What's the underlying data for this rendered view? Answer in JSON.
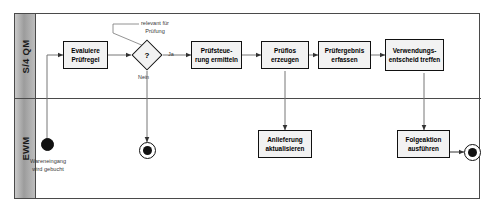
{
  "diagram": {
    "type": "bpmn-swimlane",
    "colors": {
      "lane_header_fill": "#9c9c9c",
      "task_fill": "#f2f2f2",
      "stroke": "#111111",
      "border": "#4a4a4a",
      "connector": "#555555",
      "label_text": "#3a3a3a"
    }
  },
  "lanes": [
    {
      "id": "qm",
      "label": "S/4 QM"
    },
    {
      "id": "ewm",
      "label": "EWM"
    }
  ],
  "tasks": [
    {
      "id": "evaluiere-pruefregel",
      "lane": "qm",
      "line1": "Evaluiere",
      "line2": "Prüfregel"
    },
    {
      "id": "pruefsteuerung",
      "lane": "qm",
      "line1": "Prüfsteue-",
      "line2": "rung ermitteln"
    },
    {
      "id": "pruefl0s-erzeugen",
      "lane": "qm",
      "line1": "Prüflos",
      "line2": "erzeugen"
    },
    {
      "id": "pruefergebnis-erfassen",
      "lane": "qm",
      "line1": "Prüfergebnis",
      "line2": "erfassen"
    },
    {
      "id": "verwendungsentscheid",
      "lane": "qm",
      "line1": "Verwendungs-",
      "line2": "entscheid treffen"
    },
    {
      "id": "anlieferung-aktual",
      "lane": "ewm",
      "line1": "Anlieferung",
      "line2": "aktualisieren"
    },
    {
      "id": "folgeaktion-ausfuehren",
      "lane": "ewm",
      "line1": "Folgeaktion",
      "line2": "ausführen"
    }
  ],
  "gateway": {
    "id": "pruefung-gateway",
    "symbol": "?",
    "label_yes": "Ja",
    "label_no": "Nein"
  },
  "events": [
    {
      "id": "start-wareneingang",
      "kind": "start",
      "lane": "ewm",
      "label_line1": "Wareneingang",
      "label_line2": "wird gebucht"
    },
    {
      "id": "end-nein",
      "kind": "end",
      "lane": "ewm",
      "label_line1": "",
      "label_line2": ""
    },
    {
      "id": "end-folgeaktion",
      "kind": "end",
      "lane": "ewm",
      "label_line1": "",
      "label_line2": ""
    }
  ],
  "annotations": [
    {
      "id": "relevant-fuer-pruefung",
      "line1": "relevant für",
      "line2": "Prüfung"
    }
  ]
}
